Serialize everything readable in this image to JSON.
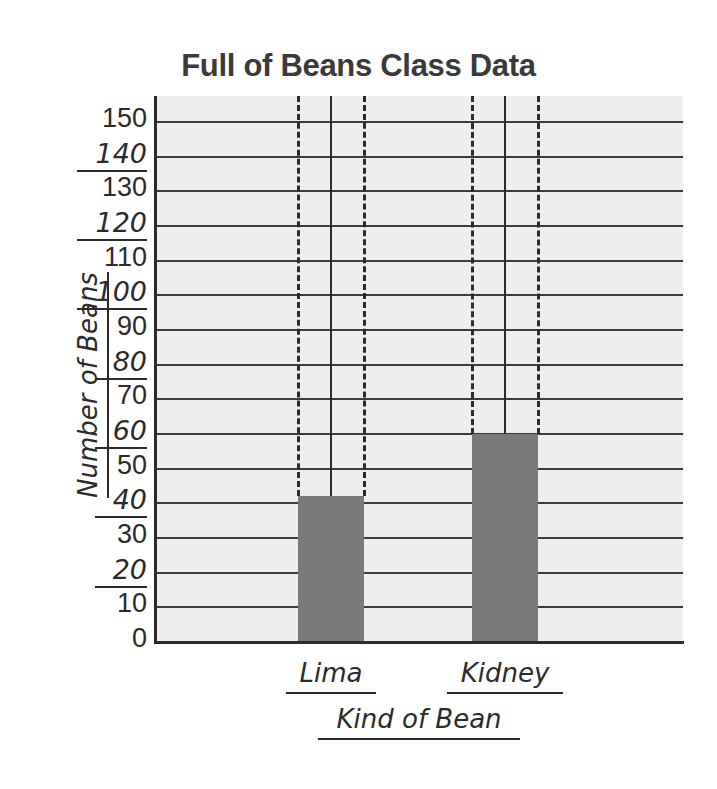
{
  "chart_data": {
    "type": "bar",
    "title": "Full of Beans Class Data",
    "xlabel": "Kind of Bean",
    "ylabel": "Number of Beans",
    "categories": [
      "Lima",
      "Kidney"
    ],
    "values": [
      42,
      60
    ],
    "ylim": [
      0,
      150
    ],
    "ytick_step": 10,
    "yticks": [
      0,
      10,
      20,
      30,
      40,
      50,
      60,
      70,
      80,
      90,
      100,
      110,
      120,
      130,
      140,
      150
    ],
    "ytick_labels": [
      "0",
      "10",
      "20",
      "30",
      "40",
      "50",
      "60",
      "70",
      "80",
      "90",
      "100",
      "110",
      "120",
      "130",
      "140",
      "150"
    ],
    "underlined_ytick_labels": [
      "20",
      "40",
      "60",
      "80",
      "100",
      "120",
      "140"
    ],
    "grid": true,
    "grid_axis": "y",
    "legend": false,
    "bar_color": "#7a7a7a",
    "plot_background": "#eeeeee",
    "gridline_color": "#3c3c3c",
    "axis_color": "#2b2b2b",
    "guide_lines": {
      "style": "dashed bar edges with solid center line",
      "color": "#2b2b2b"
    },
    "series": [
      {
        "name": "Number of Beans",
        "values": [
          42,
          60
        ]
      }
    ]
  }
}
